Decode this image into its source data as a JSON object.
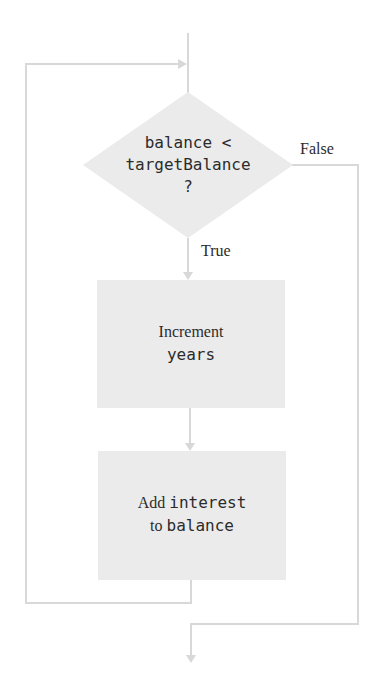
{
  "colors": {
    "line": "#d8d8d8",
    "node_fill": "#ebebeb",
    "text": "#2b2b2b"
  },
  "decision": {
    "line1": "balance <",
    "line2": "targetBalance",
    "line3": "?"
  },
  "edges": {
    "false_label": "False",
    "true_label": "True"
  },
  "steps": [
    {
      "text_serif": "Increment",
      "text_mono": "years"
    },
    {
      "text_serif_1": "Add",
      "text_mono_1": "interest",
      "text_serif_2": "to",
      "text_mono_2": "balance"
    }
  ]
}
